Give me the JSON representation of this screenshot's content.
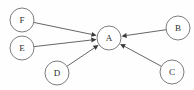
{
  "diagram": {
    "type": "directed-graph",
    "title": "",
    "background_color": "#fefefe",
    "node_fill_color": "#ffffff",
    "node_stroke_color": "#6e6e6e",
    "edge_color": "#4a4a4a",
    "label_color": "#2b2b2b",
    "node_radius": 12,
    "nodes": [
      {
        "id": "F",
        "label": "F",
        "cx": 22,
        "cy": 20
      },
      {
        "id": "E",
        "label": "E",
        "cx": 22,
        "cy": 48
      },
      {
        "id": "D",
        "label": "D",
        "cx": 57,
        "cy": 73
      },
      {
        "id": "A",
        "label": "A",
        "cx": 109,
        "cy": 38
      },
      {
        "id": "B",
        "label": "B",
        "cx": 178,
        "cy": 28
      },
      {
        "id": "C",
        "label": "C",
        "cx": 172,
        "cy": 72
      }
    ],
    "edges": [
      {
        "id": "F-A",
        "from": "F",
        "to": "A",
        "directed": true,
        "arrow_at": "to"
      },
      {
        "id": "E-A",
        "from": "E",
        "to": "A",
        "directed": true,
        "arrow_at": "to"
      },
      {
        "id": "D-A",
        "from": "D",
        "to": "A",
        "directed": true,
        "arrow_at": "to"
      },
      {
        "id": "B-A",
        "from": "B",
        "to": "A",
        "directed": true,
        "arrow_at": "to"
      },
      {
        "id": "C-A",
        "from": "C",
        "to": "A",
        "directed": true,
        "arrow_at": "to"
      }
    ]
  }
}
